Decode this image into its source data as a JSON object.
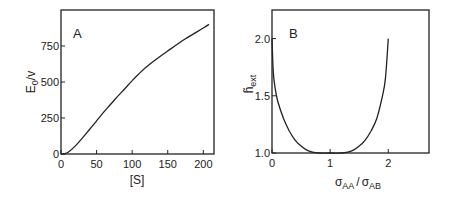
{
  "chart_data": [
    {
      "type": "line",
      "panel_label": "A",
      "title": "",
      "xlabel": "[S]",
      "ylabel": "E0/v",
      "ylabel_main": "E",
      "ylabel_sub": "0",
      "ylabel_tail": "/v",
      "xlim": [
        0,
        215
      ],
      "ylim": [
        0,
        1000
      ],
      "xticks": [
        "0",
        "50",
        "100",
        "150",
        "200"
      ],
      "yticks": [
        "0",
        "250",
        "500",
        "750"
      ],
      "grid": false,
      "legend": null,
      "series": [
        {
          "name": "E0/v",
          "x": [
            0,
            5,
            10,
            20,
            30,
            40,
            50,
            60,
            75,
            90,
            100,
            110,
            125,
            150,
            175,
            200,
            208
          ],
          "y": [
            0,
            3,
            12,
            55,
            110,
            170,
            230,
            290,
            375,
            455,
            510,
            560,
            625,
            715,
            800,
            875,
            900
          ]
        }
      ]
    },
    {
      "type": "line",
      "panel_label": "B",
      "title": "",
      "xlabel": "σAA/σAB",
      "xlabel_sigma1": "σ",
      "xlabel_sub1": "AA",
      "xlabel_sep": "/",
      "xlabel_sigma2": "σ",
      "xlabel_sub2": "AB",
      "ylabel": "h̃ext",
      "ylabel_main": "h̃",
      "ylabel_sub": "ext",
      "xlim": [
        0,
        2.7
      ],
      "ylim": [
        1.0,
        2.25
      ],
      "xticks": [
        "0",
        "1",
        "2"
      ],
      "yticks": [
        "1.0",
        "1.5",
        "2.0"
      ],
      "grid": false,
      "legend": null,
      "series": [
        {
          "name": "h_ext",
          "x": [
            0.0,
            0.02,
            0.05,
            0.1,
            0.2,
            0.3,
            0.4,
            0.5,
            0.6,
            0.7,
            0.8,
            1.0,
            1.2,
            1.3,
            1.4,
            1.5,
            1.6,
            1.7,
            1.8,
            1.9,
            1.95,
            2.0
          ],
          "y": [
            2.0,
            1.72,
            1.58,
            1.45,
            1.3,
            1.19,
            1.11,
            1.06,
            1.025,
            1.008,
            1.0,
            1.0,
            1.0,
            1.008,
            1.025,
            1.06,
            1.11,
            1.19,
            1.3,
            1.5,
            1.65,
            2.0
          ]
        }
      ]
    }
  ]
}
